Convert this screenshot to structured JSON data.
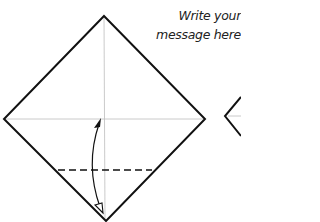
{
  "annotation": {
    "line1": "Write your",
    "line2": "message here"
  },
  "diagram": {
    "elements": [
      "diamond-paper",
      "vertical-crease",
      "horizontal-crease",
      "dashed-fold-line",
      "fold-arrow",
      "next-step-diamond"
    ]
  },
  "colors": {
    "outline": "#111111",
    "crease": "#b8b8b8",
    "background": "#ffffff"
  }
}
